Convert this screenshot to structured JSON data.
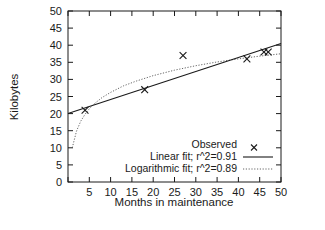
{
  "chart_data": {
    "type": "scatter",
    "title": "",
    "xlabel": "Months in maintenance",
    "ylabel": "Kilobytes",
    "xlim": [
      0,
      50
    ],
    "ylim": [
      0,
      50
    ],
    "xticks": [
      0,
      5,
      10,
      15,
      20,
      25,
      30,
      35,
      40,
      45,
      50
    ],
    "xticklabels": [
      "",
      "5",
      "10",
      "15",
      "20",
      "25",
      "30",
      "35",
      "40",
      "45",
      "50"
    ],
    "yticks": [
      0,
      5,
      10,
      15,
      20,
      25,
      30,
      35,
      40,
      45,
      50
    ],
    "yticklabels": [
      "0",
      "5",
      "10",
      "15",
      "20",
      "25",
      "30",
      "35",
      "40",
      "45",
      "50"
    ],
    "grid": false,
    "legend_position": "bottom-right-inside",
    "series": [
      {
        "name": "Observed",
        "type": "scatter",
        "marker": "x",
        "color": "#1a1a1a",
        "x": [
          4,
          18,
          27,
          42,
          46,
          47
        ],
        "y": [
          21,
          27,
          37,
          36,
          38,
          38
        ]
      },
      {
        "name": "Linear fit; r^2=0.91",
        "type": "line",
        "style": "solid",
        "color": "#1a1a1a",
        "r_squared": 0.91,
        "x": [
          0,
          50
        ],
        "y": [
          20.0,
          40.5
        ]
      },
      {
        "name": "Logarithmic fit; r^2=0.89",
        "type": "line",
        "style": "dotted",
        "color": "#555555",
        "r_squared": 0.89,
        "x": [
          1,
          2,
          3,
          4,
          5,
          6,
          8,
          10,
          13,
          16,
          20,
          25,
          30,
          35,
          40,
          45,
          50
        ],
        "y": [
          10.0,
          14.9,
          17.8,
          19.8,
          21.4,
          22.7,
          24.7,
          26.2,
          28.1,
          29.5,
          31.1,
          32.7,
          34.0,
          35.1,
          36.0,
          36.8,
          37.5
        ]
      }
    ]
  },
  "axes": {
    "ylabel": "Kilobytes",
    "xlabel": "Months in maintenance"
  },
  "legend": {
    "items": [
      {
        "label": "Observed",
        "key": "marker-x"
      },
      {
        "label": "Linear fit; r^2=0.91",
        "key": "line-solid"
      },
      {
        "label": "Logarithmic fit; r^2=0.89",
        "key": "line-dotted"
      }
    ]
  },
  "yticklabels": [
    "50",
    "45",
    "40",
    "35",
    "30",
    "25",
    "20",
    "15",
    "10",
    "5",
    "0"
  ],
  "xticklabels": [
    "5",
    "10",
    "15",
    "20",
    "25",
    "30",
    "35",
    "40",
    "45",
    "50"
  ]
}
